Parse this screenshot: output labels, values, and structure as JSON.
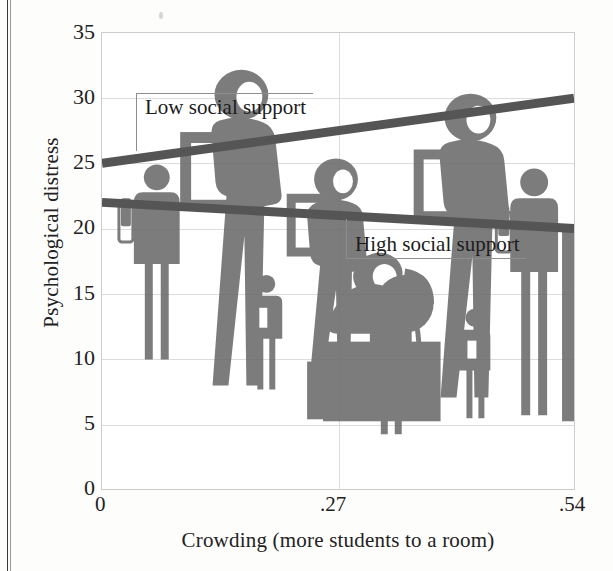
{
  "chart_data": {
    "type": "line",
    "title": "",
    "xlabel": "Crowding (more students to a room)",
    "ylabel": "Psychological distress",
    "xlim": [
      0,
      0.54
    ],
    "ylim": [
      0,
      35
    ],
    "xticks": [
      "0",
      ".27",
      ".54"
    ],
    "xtick_values": [
      0,
      0.27,
      0.54
    ],
    "yticks": [
      "0",
      "5",
      "10",
      "15",
      "20",
      "25",
      "30",
      "35"
    ],
    "ytick_values": [
      0,
      5,
      10,
      15,
      20,
      25,
      30,
      35
    ],
    "grid": true,
    "legend_position": "inline-annotations",
    "line_color": "#555555",
    "series": [
      {
        "name": "Low social support",
        "x": [
          0,
          0.54
        ],
        "values": [
          25,
          30
        ],
        "trend": "increasing"
      },
      {
        "name": "High social support",
        "x": [
          0,
          0.54
        ],
        "values": [
          22,
          20
        ],
        "trend": "decreasing"
      }
    ],
    "annotations": [
      {
        "text": "Low social support",
        "series": "Low social support"
      },
      {
        "text": "High social support",
        "series": "High social support"
      }
    ],
    "background_illustration": "silhouettes of students, a teacher at a desk with a globe, and children crowded together"
  },
  "axis": {
    "y_title": "Psychological distress",
    "x_title": "Crowding (more students to a room)",
    "y_ticks": [
      "35",
      "30",
      "25",
      "20",
      "15",
      "10",
      "5",
      "0"
    ],
    "x_ticks": [
      "0",
      ".27",
      ".54"
    ]
  },
  "annotations": {
    "low": "Low social support",
    "high": "High social support"
  },
  "colors": {
    "line": "#555555",
    "silhouette": "#6b6b6b",
    "grid": "#dcdcdc",
    "frame": "#cdcdcd",
    "text": "#1c1c1c"
  }
}
